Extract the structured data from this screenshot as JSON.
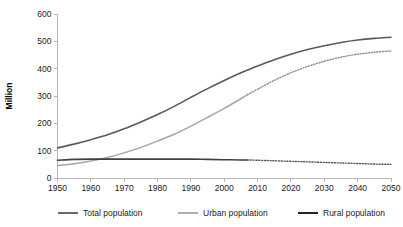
{
  "chart_data": {
    "type": "line",
    "title": "",
    "xlabel": "",
    "ylabel": "Million",
    "xlim": [
      1950,
      2050
    ],
    "ylim": [
      0,
      600
    ],
    "ytick_labels": [
      "0",
      "100",
      "200",
      "300",
      "400",
      "500",
      "600"
    ],
    "ytick_values": [
      0,
      100,
      200,
      300,
      400,
      500,
      600
    ],
    "xtick_labels": [
      "1950",
      "1960",
      "1970",
      "1980",
      "1990",
      "2000",
      "2010",
      "2020",
      "2030",
      "2040",
      "2050"
    ],
    "xtick_values": [
      1950,
      1960,
      1970,
      1980,
      1990,
      2000,
      2010,
      2020,
      2030,
      2040,
      2050
    ],
    "grid": false,
    "legend_position": "bottom",
    "projection_start_year": 2007,
    "x": [
      1950,
      1955,
      1960,
      1965,
      1970,
      1975,
      1980,
      1985,
      1990,
      1995,
      2000,
      2005,
      2007,
      2010,
      2015,
      2020,
      2025,
      2030,
      2035,
      2040,
      2045,
      2050
    ],
    "series": [
      {
        "name": "Total population",
        "color": "#595959",
        "style": "solid",
        "values": [
          110,
          124,
          140,
          158,
          180,
          205,
          232,
          262,
          295,
          327,
          357,
          385,
          395,
          410,
          433,
          453,
          470,
          484,
          496,
          505,
          511,
          515
        ]
      },
      {
        "name": "Urban population",
        "color": "#a6a6a6",
        "style": "solid-then-dotted",
        "values": [
          45,
          52,
          62,
          75,
          92,
          112,
          135,
          160,
          190,
          222,
          255,
          290,
          305,
          325,
          357,
          385,
          408,
          427,
          442,
          453,
          460,
          465
        ]
      },
      {
        "name": "Rural population",
        "color": "#404040",
        "style": "solid-then-dotted",
        "values": [
          65,
          68,
          69,
          69,
          69,
          69,
          69,
          69,
          69,
          68,
          67,
          66,
          66,
          65,
          63,
          61,
          59,
          57,
          55,
          53,
          51,
          50
        ]
      }
    ],
    "legend": [
      {
        "label": "Total population",
        "color": "#595959"
      },
      {
        "label": "Urban population",
        "color": "#a6a6a6"
      },
      {
        "label": "Rural population",
        "color": "#262626"
      }
    ]
  }
}
